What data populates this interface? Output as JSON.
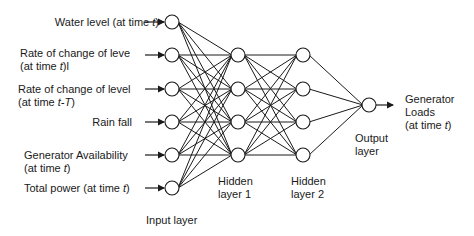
{
  "diagram": {
    "type": "neural-network",
    "inputs": [
      {
        "line1": "Water level (at time ",
        "var1": "t",
        "close1": ")",
        "line2": ""
      },
      {
        "line1": "Rate of change of leve",
        "var1": "",
        "close1": "",
        "line2": "(at time ",
        "var2": "t",
        "close2": ")l"
      },
      {
        "line1": "Rate of change of level",
        "var1": "",
        "close1": "",
        "line2": "(at time ",
        "var2": "t-T",
        "close2": ")"
      },
      {
        "line1": "Rain fall",
        "var1": "",
        "close1": "",
        "line2": ""
      },
      {
        "line1": "Generator Availability",
        "var1": "",
        "close1": "",
        "line2": "(at time ",
        "var2": "t",
        "close2": ")"
      },
      {
        "line1": "Total power (at time ",
        "var1": "t",
        "close1": ")",
        "line2": ""
      }
    ],
    "layers": {
      "input": {
        "label": "Input layer",
        "nodes": 6
      },
      "hidden1": {
        "label_line1": "Hidden",
        "label_line2": "layer 1",
        "nodes": 4
      },
      "hidden2": {
        "label_line1": "Hidden",
        "label_line2": "layer 2",
        "nodes": 4
      },
      "output": {
        "label_line1": "Output",
        "label_line2": "layer",
        "nodes": 1
      }
    },
    "output_label": {
      "line1": "Generator",
      "line2": "Loads",
      "line3": "(at time ",
      "var": "t",
      "close": ")"
    }
  }
}
